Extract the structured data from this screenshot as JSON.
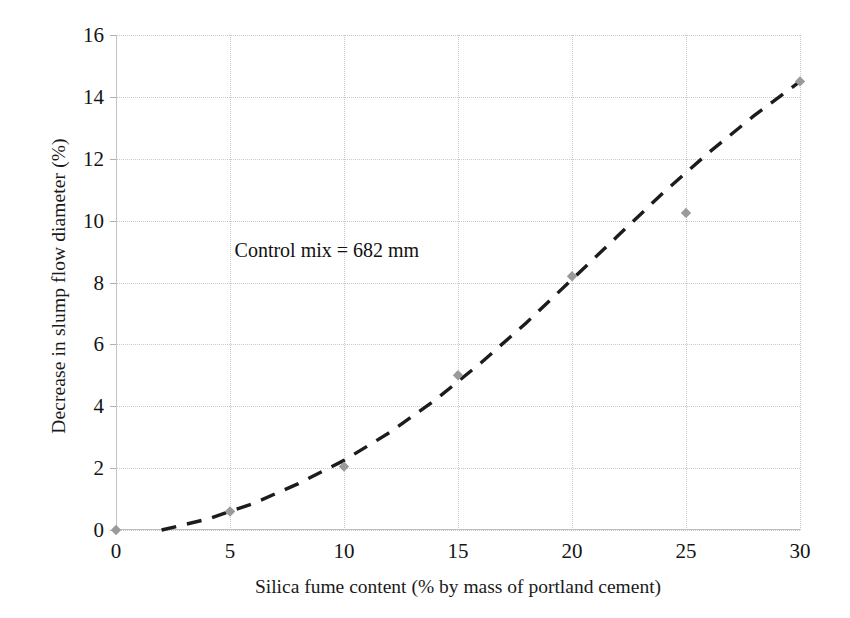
{
  "chart_data": {
    "type": "scatter",
    "title": "",
    "xlabel": "Silica fume content (% by mass of portland cement)",
    "ylabel": "Decrease in slump flow diameter (%)",
    "xlim": [
      0,
      30
    ],
    "ylim": [
      0,
      16
    ],
    "xticks": [
      0,
      5,
      10,
      15,
      20,
      25,
      30
    ],
    "yticks": [
      0,
      2,
      4,
      6,
      8,
      10,
      12,
      14,
      16
    ],
    "xtick_labels": [
      "0",
      "5",
      "10",
      "15",
      "20",
      "25",
      "30"
    ],
    "ytick_labels": [
      "0",
      "2",
      "4",
      "6",
      "8",
      "10",
      "12",
      "14",
      "16"
    ],
    "grid": true,
    "legend": "none",
    "x": [
      0,
      5,
      10,
      15,
      20,
      25,
      30
    ],
    "values": [
      0.0,
      0.6,
      2.05,
      5.0,
      8.2,
      10.25,
      14.5
    ],
    "series": [
      {
        "name": "Decrease in slump flow diameter",
        "marker": "diamond",
        "marker_color": "#9a9a9a",
        "x": [
          0,
          5,
          10,
          15,
          20,
          25,
          30
        ],
        "values": [
          0.0,
          0.6,
          2.05,
          5.0,
          8.2,
          10.25,
          14.5
        ]
      }
    ],
    "trendline": {
      "style": "dashed",
      "color": "#1c1c1c",
      "x": [
        2.0,
        4,
        6,
        8,
        10,
        12,
        14,
        16,
        18,
        20,
        22,
        24,
        26,
        28,
        30
      ],
      "y": [
        0.0,
        0.35,
        0.85,
        1.5,
        2.25,
        3.15,
        4.2,
        5.4,
        6.7,
        8.1,
        9.5,
        10.9,
        12.2,
        13.4,
        14.5
      ]
    },
    "annotations": [
      {
        "text": "Control mix = 682 mm",
        "x": 5.2,
        "y": 9.0
      }
    ],
    "colors": {
      "marker": "#9a9a9a",
      "trendline": "#1c1c1c",
      "grid": "#c9c9c9",
      "axis": "#bdbdbd",
      "text": "#141414",
      "background": "#ffffff"
    }
  }
}
